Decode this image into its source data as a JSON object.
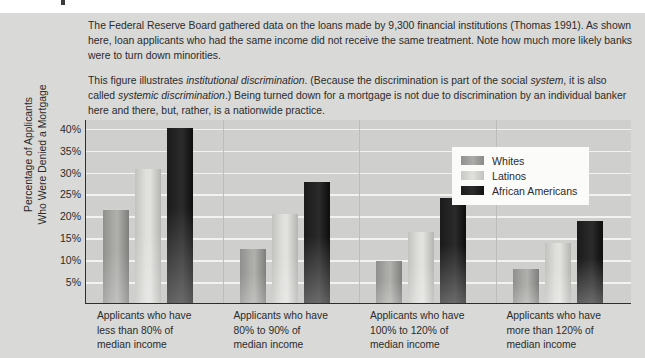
{
  "caption": {
    "paragraph1_part1": "The Federal Reserve Board gathered data on the loans made by 9,300 financial institutions (Thomas 1991). As shown here, loan applicants who had the same income did not receive the same treatment. Note how much more likely banks were to turn down minorities.",
    "p2_a": "This figure illustrates ",
    "p2_em1": "institutional discrimination",
    "p2_b": ". (Because the discrimination is part of the social ",
    "p2_em2": "system",
    "p2_c": ", it is also called ",
    "p2_em3": "systemic discrimination",
    "p2_d": ".) Being turned down for a mortgage is not due to discrimination by an individual banker here and there, but, rather, is a nationwide practice."
  },
  "chart_data": {
    "type": "bar",
    "title": "",
    "xlabel": "",
    "ylabel": "Percentage of Applicants\nWho Were Denied a Mortgage",
    "ylim": [
      0,
      42
    ],
    "yticks": [
      40,
      35,
      30,
      25,
      20,
      15,
      10,
      5
    ],
    "ytick_labels": [
      "40%",
      "35%",
      "30%",
      "25%",
      "20%",
      "15%",
      "10%",
      "5%"
    ],
    "grid": true,
    "legend_position": "top-right",
    "categories": [
      "Applicants who have\nless than 80% of\nmedian income",
      "Applicants who have\n80% to 90% of\nmedian income",
      "Applicants who have\n100% to 120% of\nmedian income",
      "Applicants who have\nmore than 120% of\nmedian income"
    ],
    "series": [
      {
        "name": "Whites",
        "color": "#a0a09d",
        "values": [
          21.2,
          12.4,
          9.7,
          7.8
        ]
      },
      {
        "name": "Latinos",
        "color": "#d8d8d5",
        "values": [
          30.7,
          20.4,
          16.1,
          13.7
        ]
      },
      {
        "name": "African Americans",
        "color": "#1a1a1a",
        "values": [
          40.0,
          27.7,
          24.0,
          18.7
        ]
      }
    ]
  }
}
